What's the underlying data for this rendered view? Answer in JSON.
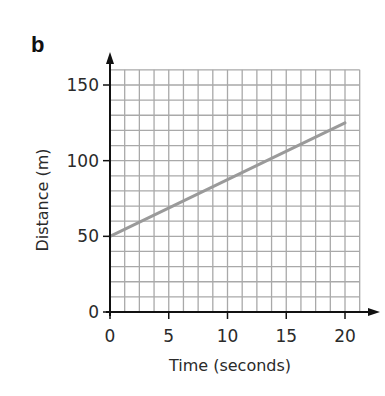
{
  "panel": {
    "label": "b"
  },
  "colors": {
    "axis": "#111111",
    "grid": "#a9a9a9",
    "series": "#9a9a9a",
    "background": "#ffffff"
  },
  "chart_data": {
    "type": "line",
    "title": "",
    "xlabel": "Time (seconds)",
    "ylabel": "Distance (m)",
    "xlim": [
      0,
      21.25
    ],
    "ylim": [
      0,
      160
    ],
    "x_ticks": [
      0,
      5,
      10,
      15,
      20
    ],
    "y_ticks": [
      0,
      50,
      100,
      150
    ],
    "x_tick_labels": [
      "0",
      "5",
      "10",
      "15",
      "20"
    ],
    "y_tick_labels": [
      "0",
      "50",
      "100",
      "150"
    ],
    "grid": true,
    "grid_x_step": 1.25,
    "grid_y_step": 10,
    "legend": null,
    "series": [
      {
        "name": "distance",
        "x": [
          0,
          20
        ],
        "y": [
          50,
          125
        ]
      }
    ]
  }
}
